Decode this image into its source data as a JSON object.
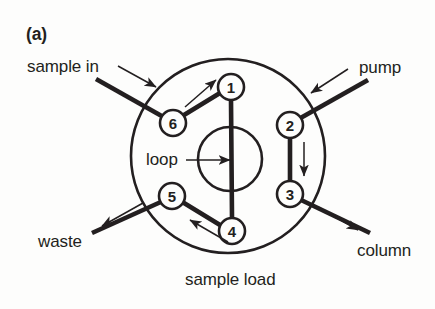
{
  "figure": {
    "panel_label": "(a)",
    "caption": "sample load",
    "background_color": "#fdfdfc",
    "ink_color": "#231f20",
    "type": "six-port-injection-valve-diagram"
  },
  "valve": {
    "outer_circle": {
      "cx": 228,
      "cy": 156,
      "r": 97
    },
    "loop_circle": {
      "cx": 230,
      "cy": 159,
      "r": 32
    },
    "loop_label": "loop",
    "port_radius": 13
  },
  "ports": [
    {
      "id": "1",
      "label": "1",
      "cx": 231,
      "cy": 87
    },
    {
      "id": "2",
      "label": "2",
      "cx": 290,
      "cy": 125
    },
    {
      "id": "3",
      "label": "3",
      "cx": 290,
      "cy": 194
    },
    {
      "id": "4",
      "label": "4",
      "cx": 232,
      "cy": 231
    },
    {
      "id": "5",
      "label": "5",
      "cx": 172,
      "cy": 196
    },
    {
      "id": "6",
      "label": "6",
      "cx": 173,
      "cy": 123
    }
  ],
  "internal_connections": [
    {
      "name": "port-6-to-port-1",
      "from": "6",
      "to": "1",
      "flow": "toward-1"
    },
    {
      "name": "port-1-to-port-4",
      "from": "1",
      "to": "4",
      "flow": "none"
    },
    {
      "name": "port-2-to-port-3",
      "from": "2",
      "to": "3",
      "flow": "toward-3"
    },
    {
      "name": "port-4-to-port-5",
      "from": "4",
      "to": "5",
      "flow": "toward-5"
    }
  ],
  "external_lines": [
    {
      "name": "sample-in-line",
      "label": "sample in",
      "port": "6",
      "direction": "in"
    },
    {
      "name": "pump-line",
      "label": "pump",
      "port": "2",
      "direction": "in"
    },
    {
      "name": "waste-line",
      "label": "waste",
      "port": "5",
      "direction": "out"
    },
    {
      "name": "column-line",
      "label": "column",
      "port": "3",
      "direction": "out"
    }
  ],
  "labels": {
    "panel": "(a)",
    "sample_in": "sample in",
    "pump": "pump",
    "loop": "loop",
    "waste": "waste",
    "column": "column",
    "sample_load": "sample load"
  }
}
